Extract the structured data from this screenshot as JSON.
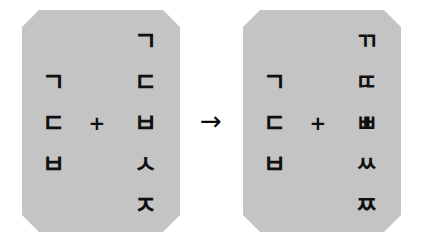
{
  "diagram": {
    "type": "hangul-consonant-doubling",
    "background_color": "#ffffff",
    "panel_color": "#c4c4c4",
    "glyph_color": "#101010",
    "operator_symbol": "+",
    "arrow_symbol": "→",
    "source_panel": {
      "name": "plain-consonants",
      "rows": [
        {
          "left": "",
          "op": "",
          "right": "ㄱ"
        },
        {
          "left": "ㄱ",
          "op": "",
          "right": "ㄷ"
        },
        {
          "left": "ㄷ",
          "op": "+",
          "right": "ㅂ"
        },
        {
          "left": "ㅂ",
          "op": "",
          "right": "ㅅ"
        },
        {
          "left": "",
          "op": "",
          "right": "ㅈ"
        }
      ]
    },
    "result_panel": {
      "name": "tense-consonants",
      "rows": [
        {
          "left": "",
          "op": "",
          "right": "ㄲ"
        },
        {
          "left": "ㄱ",
          "op": "",
          "right": "ㄸ"
        },
        {
          "left": "ㄷ",
          "op": "+",
          "right": "ㅃ"
        },
        {
          "left": "ㅂ",
          "op": "",
          "right": "ㅆ"
        },
        {
          "left": "",
          "op": "",
          "right": "ㅉ"
        }
      ]
    }
  }
}
